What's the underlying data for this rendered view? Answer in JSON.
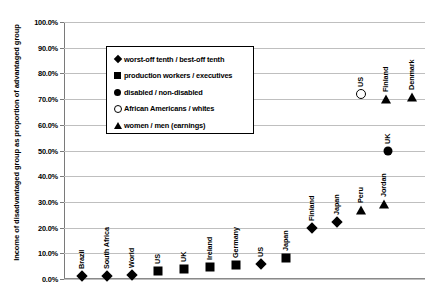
{
  "chart_data": {
    "type": "scatter",
    "title": "",
    "xlabel": "",
    "ylabel": "Income of disadvantaged group as proportion of advantaged group",
    "ylim": [
      0,
      100
    ],
    "ytick_labels": [
      "0.0%",
      "10.0%",
      "20.0%",
      "30.0%",
      "40.0%",
      "50.0%",
      "60.0%",
      "70.0%",
      "80.0%",
      "90.0%",
      "100.0%"
    ],
    "ytick_values": [
      0,
      10,
      20,
      30,
      40,
      50,
      60,
      70,
      80,
      90,
      100
    ],
    "grid": true,
    "legend_position": "upper-left-inside",
    "series": [
      {
        "name": "worst-off tenth / best-off tenth",
        "marker": "diamond",
        "points": [
          {
            "label": "Brazil",
            "value": 1.0
          },
          {
            "label": "South Africa",
            "value": 1.2
          },
          {
            "label": "World",
            "value": 1.5
          },
          {
            "label": "US",
            "value": 6.0
          },
          {
            "label": "Finland",
            "value": 20.0
          },
          {
            "label": "Japan",
            "value": 22.0
          }
        ]
      },
      {
        "name": "production workers / executives",
        "marker": "square",
        "points": [
          {
            "label": "US",
            "value": 3.0
          },
          {
            "label": "UK",
            "value": 4.0
          },
          {
            "label": "Ireland",
            "value": 4.5
          },
          {
            "label": "Germany",
            "value": 5.5
          },
          {
            "label": "Japan",
            "value": 8.0
          }
        ]
      },
      {
        "name": "disabled / non-disabled",
        "marker": "circle",
        "points": [
          {
            "label": "UK",
            "value": 50.0
          }
        ]
      },
      {
        "name": "African Americans / whites",
        "marker": "open-circle",
        "points": [
          {
            "label": "US",
            "value": 72.0
          }
        ]
      },
      {
        "name": "women / men (earnings)",
        "marker": "triangle",
        "points": [
          {
            "label": "Peru",
            "value": 27.0
          },
          {
            "label": "Jordan",
            "value": 29.0
          },
          {
            "label": "Finland",
            "value": 70.0
          },
          {
            "label": "Denmark",
            "value": 71.0
          }
        ]
      }
    ],
    "plotted_points": [
      {
        "label": "Brazil",
        "value": 1.0,
        "marker": "diamond",
        "x": 18
      },
      {
        "label": "South Africa",
        "value": 1.2,
        "marker": "diamond",
        "x": 43
      },
      {
        "label": "World",
        "value": 1.5,
        "marker": "diamond",
        "x": 68
      },
      {
        "label": "US",
        "value": 3.0,
        "marker": "square",
        "x": 94
      },
      {
        "label": "UK",
        "value": 4.0,
        "marker": "square",
        "x": 120
      },
      {
        "label": "Ireland",
        "value": 4.5,
        "marker": "square",
        "x": 146
      },
      {
        "label": "Germany",
        "value": 5.5,
        "marker": "square",
        "x": 172
      },
      {
        "label": "US",
        "value": 6.0,
        "marker": "diamond",
        "x": 197
      },
      {
        "label": "Japan",
        "value": 8.0,
        "marker": "square",
        "x": 222
      },
      {
        "label": "Finland",
        "value": 20.0,
        "marker": "diamond",
        "x": 248
      },
      {
        "label": "Japan",
        "value": 22.0,
        "marker": "diamond",
        "x": 273
      },
      {
        "label": "Peru",
        "value": 27.0,
        "marker": "triangle",
        "x": 297
      },
      {
        "label": "Jordan",
        "value": 29.0,
        "marker": "triangle",
        "x": 320
      },
      {
        "label": "UK",
        "value": 50.0,
        "marker": "circle",
        "x": 324
      },
      {
        "label": "US",
        "value": 72.0,
        "marker": "open-circle",
        "x": 297
      },
      {
        "label": "Finland",
        "value": 70.0,
        "marker": "triangle",
        "x": 322
      },
      {
        "label": "Denmark",
        "value": 71.0,
        "marker": "triangle",
        "x": 348
      }
    ]
  },
  "legend": {
    "items": [
      {
        "marker": "diamond",
        "label": "worst-off tenth / best-off tenth"
      },
      {
        "marker": "square",
        "label": "production workers / executives"
      },
      {
        "marker": "circle",
        "label": "disabled / non-disabled"
      },
      {
        "marker": "open-circle",
        "label": "African Americans / whites"
      },
      {
        "marker": "triangle",
        "label": "women / men (earnings)"
      }
    ]
  },
  "colors": {
    "marker": "#000000",
    "grid": "#bfbfbf",
    "axis": "#7a7a7a",
    "background": "#ffffff"
  }
}
